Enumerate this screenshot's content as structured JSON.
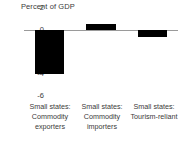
{
  "chart_data": {
    "type": "bar",
    "title": "Percent of GDP",
    "xlabel": "",
    "ylabel": "",
    "ylim": [
      -6,
      2
    ],
    "yticks": [
      "2",
      "0",
      "-2",
      "-4",
      "-6"
    ],
    "grid": false,
    "legend": null,
    "bar_color": "#000000",
    "axis_color": "#9a9a9a",
    "text_color": "#3a3a3a",
    "categories": [
      "Small states: Commodity exporters",
      "Small states: Commodity importers",
      "Small states: Tourism-reliant"
    ],
    "category_lines": [
      [
        "Small states:",
        "Commodity",
        "exporters"
      ],
      [
        "Small states:",
        "Commodity",
        "importers"
      ],
      [
        "Small states:",
        "Tourism-reliant"
      ]
    ],
    "values": [
      -4.0,
      0.55,
      -0.6
    ]
  }
}
